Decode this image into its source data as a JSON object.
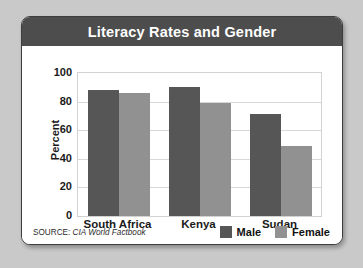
{
  "card": {
    "title": "Literacy Rates and Gender"
  },
  "footer": {
    "source_label": "SOURCE:",
    "source_value": "CIA World Factbook"
  },
  "legend": {
    "items": [
      {
        "label": "Male",
        "color": "#565656",
        "icon": "square-swatch-icon"
      },
      {
        "label": "Female",
        "color": "#919191",
        "icon": "square-swatch-icon"
      }
    ]
  },
  "chart_data": {
    "type": "bar",
    "title": "Literacy Rates and Gender",
    "subtitle": "",
    "xlabel": "",
    "ylabel": "Percent",
    "categories": [
      "South Africa",
      "Kenya",
      "Sudan"
    ],
    "series": [
      {
        "name": "Male",
        "color": "#565656",
        "values": [
          88,
          90,
          71
        ]
      },
      {
        "name": "Female",
        "color": "#919191",
        "values": [
          86,
          79,
          49
        ]
      }
    ],
    "ylim": [
      0,
      100
    ],
    "yticks": [
      100,
      80,
      60,
      40,
      20,
      0
    ],
    "ytick_labels": [
      "100",
      "80",
      "60",
      "40",
      "20",
      "0"
    ],
    "grid": true,
    "grid_axis": "y",
    "legend_position": "bottom-right",
    "source": "SOURCE: CIA World Factbook"
  }
}
